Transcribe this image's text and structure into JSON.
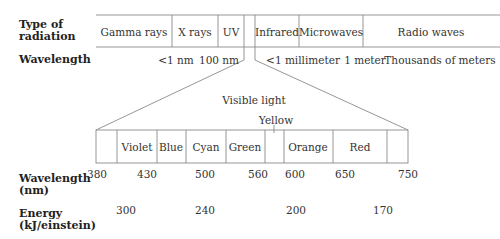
{
  "row_labels": {
    "type_of_radiation": "Type of\nradiation",
    "type_line1": "Type of",
    "type_line2": "radiation",
    "wavelength": "Wavelength",
    "wavelength_nm_line1": "Wavelength",
    "wavelength_nm_line2": "(nm)",
    "energy_line1": "Energy",
    "energy_line2": "(kJ/einstein)"
  },
  "spectrum": {
    "bands": [
      {
        "label": "Gamma rays"
      },
      {
        "label": "X rays"
      },
      {
        "label": "UV"
      },
      {
        "label": ""
      },
      {
        "label": "Infrared"
      },
      {
        "label": "Microwaves"
      },
      {
        "label": "Radio waves"
      }
    ],
    "wavelengths": [
      "<1 nm",
      "100 nm",
      "<1 millimeter",
      "1 meter",
      "Thousands of meters"
    ]
  },
  "visible": {
    "title": "Visible light",
    "yellow_label": "Yellow",
    "colors": [
      {
        "label": ""
      },
      {
        "label": "Violet"
      },
      {
        "label": "Blue"
      },
      {
        "label": "Cyan"
      },
      {
        "label": "Green"
      },
      {
        "label": ""
      },
      {
        "label": "Orange"
      },
      {
        "label": "Red"
      },
      {
        "label": ""
      }
    ],
    "wavelengths_nm": [
      "380",
      "430",
      "500",
      "560",
      "600",
      "650",
      "750"
    ],
    "energies_kj_per_einstein": [
      "300",
      "240",
      "200",
      "170"
    ]
  },
  "colors": {
    "line": "#8a8a8a",
    "text": "#333333"
  }
}
